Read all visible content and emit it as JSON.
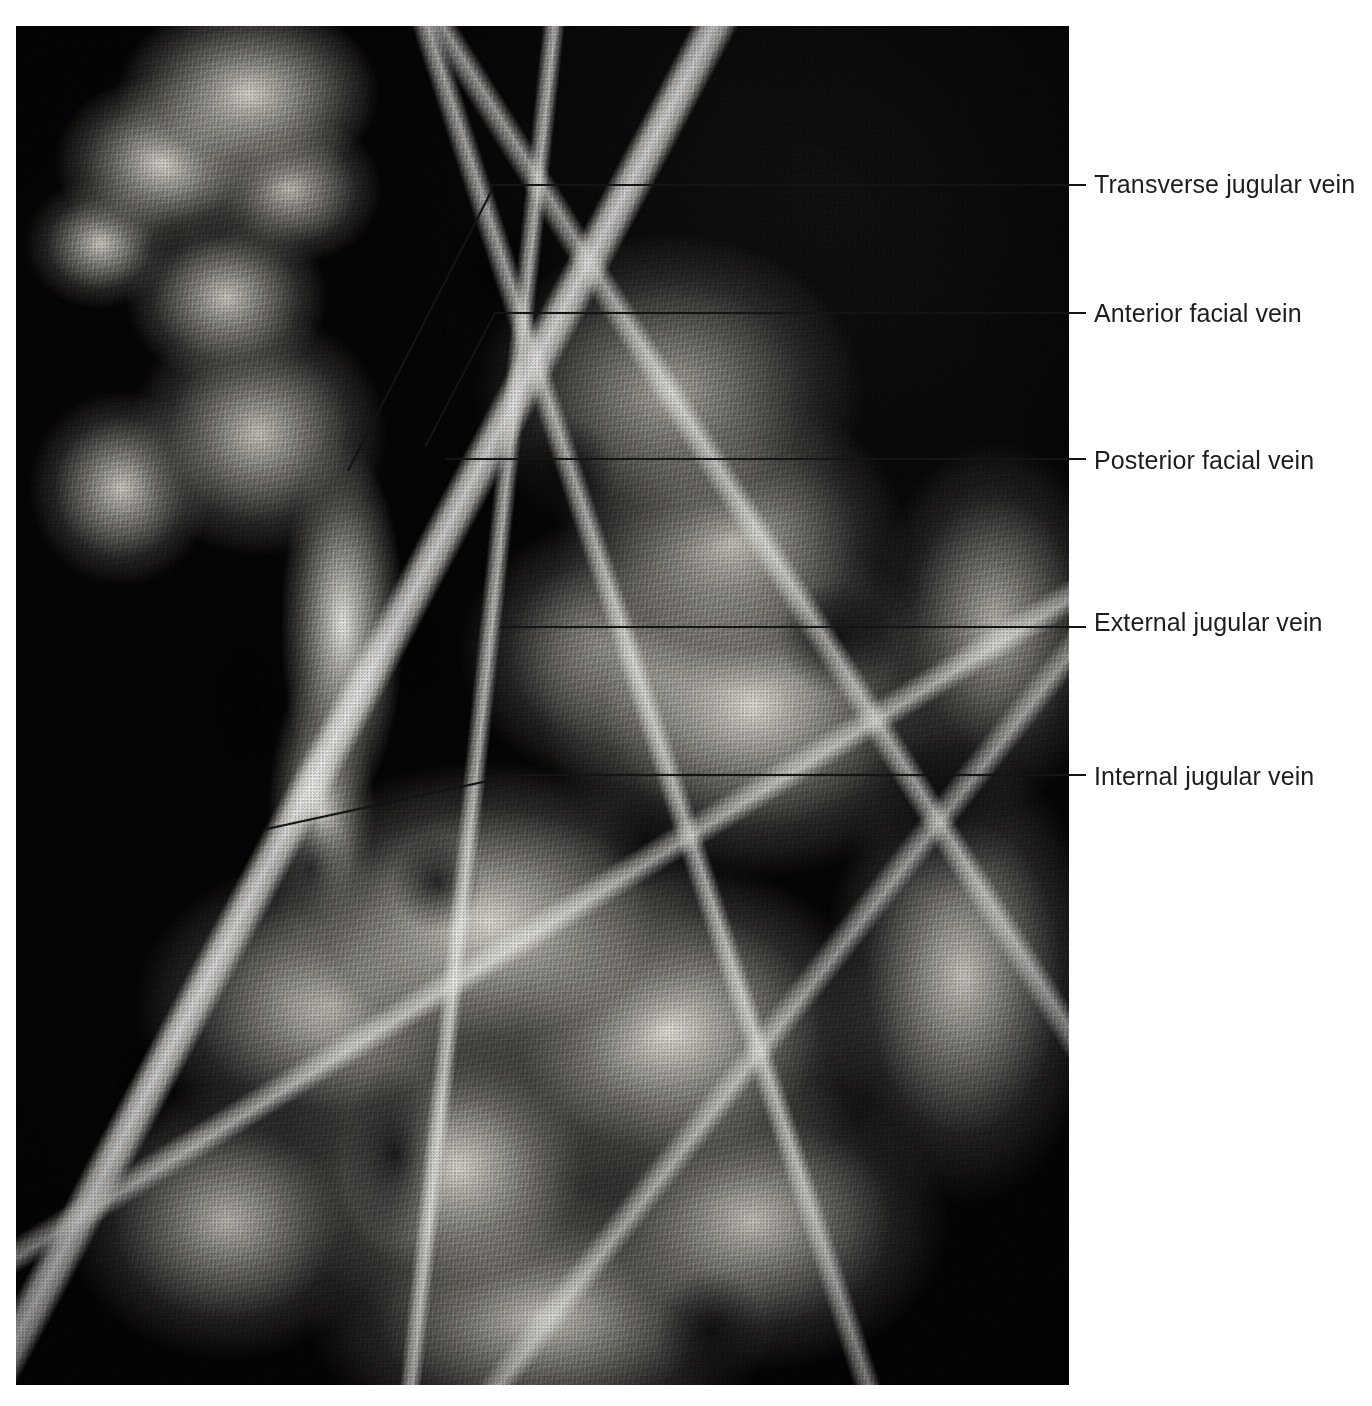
{
  "figure": {
    "kind": "anatomical-dissection-photograph",
    "background_color": "#050505",
    "page_color": "#ffffff",
    "label_color": "#1d1d1d",
    "leader_color": "#141414"
  },
  "labels": [
    {
      "id": "transverse-jugular-vein",
      "text": "Transverse jugular vein",
      "text_x": 1094,
      "text_y": 178,
      "leader": [
        [
          1086,
          185
        ],
        [
          492,
          185
        ],
        [
          492,
          190
        ],
        [
          348,
          471
        ]
      ]
    },
    {
      "id": "anterior-facial-vein",
      "text": "Anterior facial vein",
      "text_x": 1094,
      "text_y": 307,
      "leader": [
        [
          1086,
          313
        ],
        [
          495,
          313
        ],
        [
          425,
          447
        ]
      ]
    },
    {
      "id": "posterior-facial-vein",
      "text": "Posterior facial vein",
      "text_x": 1094,
      "text_y": 454,
      "leader": [
        [
          1086,
          459
        ],
        [
          445,
          459
        ]
      ]
    },
    {
      "id": "external-jugular-vein",
      "text": "External jugular vein",
      "text_x": 1094,
      "text_y": 616,
      "leader": [
        [
          1086,
          627
        ],
        [
          500,
          627
        ]
      ]
    },
    {
      "id": "internal-jugular-vein",
      "text": "Internal jugular vein",
      "text_x": 1094,
      "text_y": 770,
      "leader": [
        [
          1086,
          775
        ],
        [
          515,
          775
        ],
        [
          262,
          830
        ]
      ]
    }
  ]
}
